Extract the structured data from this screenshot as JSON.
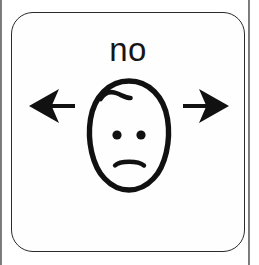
{
  "card": {
    "caption": "no",
    "border_color": "#2b2b2b",
    "background_color": "#fefefe",
    "ink_color": "#111111",
    "shape": "rounded-square"
  },
  "symbol": {
    "name": "no",
    "type": "aac-pictogram",
    "description": "head shaking side to side with a frowning face",
    "parts": [
      {
        "name": "left-arrow",
        "direction": "left"
      },
      {
        "name": "face",
        "expression": "frown"
      },
      {
        "name": "right-arrow",
        "direction": "right"
      }
    ]
  },
  "face": {
    "outline": "egg",
    "hair_curl": true,
    "eyes": 2,
    "mouth": "frown"
  },
  "colors": {
    "ink": "#111111",
    "paper": "#ffffff",
    "card_fill": "#fefefe",
    "card_stroke": "#2b2b2b",
    "scan_edge": "#3a3a3a"
  }
}
